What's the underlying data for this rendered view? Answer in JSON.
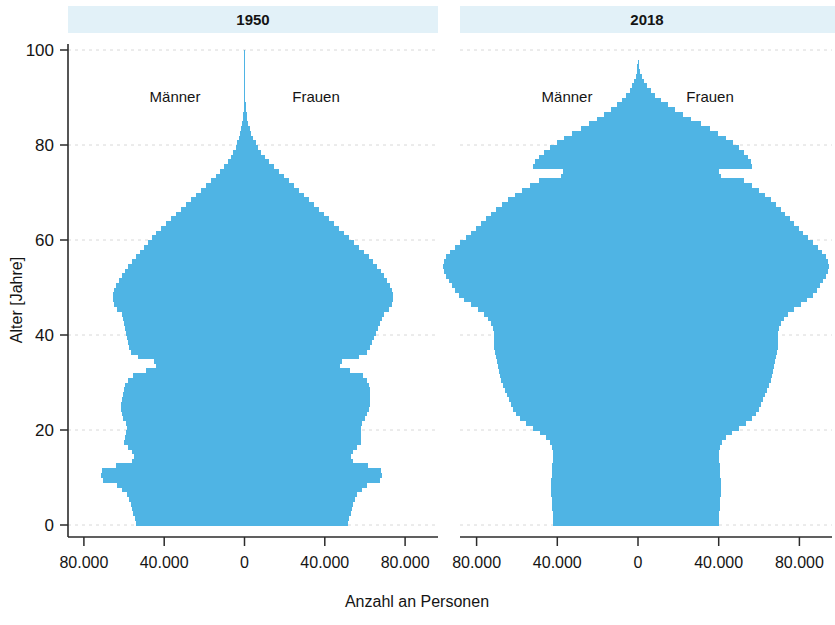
{
  "figure": {
    "xlabel": "Anzahl an Personen",
    "ylabel": "Alter [Jahre]"
  },
  "panels": [
    {
      "title": "1950",
      "male_label": "Männer",
      "female_label": "Frauen",
      "xticks": [
        "80.000",
        "40.000",
        "0",
        "40.000",
        "80.000"
      ]
    },
    {
      "title": "2018",
      "male_label": "Männer",
      "female_label": "Frauen",
      "xticks": [
        "80.000",
        "40.000",
        "0",
        "40.000",
        "80.000"
      ]
    }
  ],
  "yticks": [
    "0",
    "20",
    "40",
    "60",
    "80",
    "100"
  ],
  "colors": {
    "bar": "#4fb4e4",
    "panel_title_bg": "#e2f1f8",
    "axis": "#2b2b2b",
    "grid": "#d8d8d8",
    "text": "#141414"
  },
  "chart_data": {
    "type": "bar",
    "orientation": "horizontal",
    "subtype": "population-pyramid",
    "title": "",
    "xlabel": "Anzahl an Personen",
    "ylabel": "Alter [Jahre]",
    "xlim": [
      -100000,
      100000
    ],
    "ylim": [
      0,
      103
    ],
    "xtick_values": [
      -80000,
      -40000,
      0,
      40000,
      80000
    ],
    "xtick_labels": [
      "80.000",
      "40.000",
      "0",
      "40.000",
      "80.000"
    ],
    "ytick_values": [
      0,
      20,
      40,
      60,
      80,
      100
    ],
    "ytick_labels": [
      "0",
      "20",
      "40",
      "60",
      "80",
      "100"
    ],
    "grid": true,
    "legend": false,
    "ages": [
      0,
      1,
      2,
      3,
      4,
      5,
      6,
      7,
      8,
      9,
      10,
      11,
      12,
      13,
      14,
      15,
      16,
      17,
      18,
      19,
      20,
      21,
      22,
      23,
      24,
      25,
      26,
      27,
      28,
      29,
      30,
      31,
      32,
      33,
      34,
      35,
      36,
      37,
      38,
      39,
      40,
      41,
      42,
      43,
      44,
      45,
      46,
      47,
      48,
      49,
      50,
      51,
      52,
      53,
      54,
      55,
      56,
      57,
      58,
      59,
      60,
      61,
      62,
      63,
      64,
      65,
      66,
      67,
      68,
      69,
      70,
      71,
      72,
      73,
      74,
      75,
      76,
      77,
      78,
      79,
      80,
      81,
      82,
      83,
      84,
      85,
      86,
      87,
      88,
      89,
      90,
      91,
      92,
      93,
      94,
      95,
      96,
      97,
      98,
      99,
      100
    ],
    "panels": [
      {
        "name": "1950",
        "series": [
          {
            "name": "Männer",
            "side": "left",
            "values": [
              54000,
              54500,
              55500,
              56000,
              56500,
              57500,
              58500,
              61000,
              63500,
              70500,
              71500,
              71000,
              64000,
              56000,
              55000,
              56000,
              58000,
              60000,
              59500,
              59000,
              58500,
              59000,
              60500,
              61000,
              61500,
              61500,
              61000,
              60500,
              60000,
              59500,
              58000,
              55500,
              49000,
              44000,
              45000,
              53000,
              56500,
              57500,
              58000,
              58500,
              59000,
              59500,
              60000,
              60500,
              61000,
              63500,
              65000,
              65500,
              65500,
              65000,
              64000,
              62500,
              61000,
              59500,
              58000,
              56000,
              54000,
              52000,
              50000,
              48000,
              46000,
              44000,
              41500,
              39000,
              36500,
              34000,
              31500,
              29000,
              26500,
              24000,
              21500,
              19000,
              16500,
              14000,
              12000,
              10000,
              8200,
              6800,
              5500,
              4400,
              3500,
              2700,
              2100,
              1600,
              1200,
              900,
              650,
              480,
              340,
              240,
              165,
              110,
              75,
              48,
              30,
              18,
              10,
              6,
              3,
              1
            ]
          },
          {
            "name": "Frauen",
            "side": "right",
            "values": [
              51500,
              52000,
              53000,
              53500,
              54000,
              55000,
              56000,
              58500,
              61000,
              67500,
              68500,
              68000,
              61500,
              54000,
              53000,
              54000,
              56000,
              58000,
              58000,
              58000,
              58000,
              58500,
              60000,
              61000,
              62000,
              62500,
              62500,
              62500,
              62500,
              62000,
              61000,
              59000,
              52500,
              47500,
              48500,
              57000,
              61000,
              62500,
              63500,
              64500,
              65500,
              66500,
              67500,
              68500,
              69500,
              72000,
              73500,
              74000,
              74000,
              73500,
              72500,
              71000,
              69500,
              68000,
              66000,
              64000,
              62000,
              59500,
              57000,
              54500,
              52000,
              49500,
              47000,
              44500,
              42000,
              39500,
              37000,
              34500,
              32000,
              29500,
              27000,
              24500,
              22000,
              19500,
              17000,
              14500,
              12200,
              10200,
              8400,
              6800,
              5500,
              4300,
              3300,
              2500,
              1900,
              1400,
              1000,
              720,
              500,
              340,
              225,
              145,
              95,
              58,
              35,
              20,
              12,
              7,
              4,
              2
            ]
          }
        ]
      },
      {
        "name": "2018",
        "series": [
          {
            "name": "Männer",
            "side": "left",
            "values": [
              42000,
              42000,
              42200,
              42400,
              42600,
              42800,
              43000,
              43000,
              43000,
              43000,
              42800,
              42600,
              42400,
              42200,
              42000,
              42000,
              42500,
              43500,
              45500,
              48500,
              52000,
              55500,
              58500,
              60500,
              62000,
              63000,
              64000,
              65000,
              66000,
              67000,
              68000,
              68500,
              69000,
              69500,
              70000,
              70500,
              71000,
              71500,
              71500,
              71500,
              71500,
              72000,
              73000,
              74500,
              76500,
              79500,
              83000,
              86000,
              88500,
              90500,
              92000,
              93500,
              95000,
              96000,
              96500,
              96000,
              95000,
              93000,
              90500,
              88000,
              85500,
              83000,
              80500,
              78000,
              75500,
              73000,
              70500,
              67500,
              64500,
              61000,
              57500,
              53500,
              49000,
              38000,
              37000,
              52000,
              51000,
              49000,
              46500,
              43500,
              40000,
              36500,
              32500,
              28500,
              24500,
              20500,
              16800,
              13500,
              10500,
              8000,
              5800,
              4100,
              2800,
              1800,
              1100,
              650,
              350,
              180,
              90,
              40,
              15
            ]
          },
          {
            "name": "Frauen",
            "side": "right",
            "values": [
              40000,
              40000,
              40200,
              40400,
              40600,
              40800,
              41000,
              41000,
              41000,
              41000,
              40800,
              40600,
              40400,
              40200,
              40000,
              40000,
              40500,
              41500,
              43500,
              46500,
              50000,
              53500,
              56500,
              58500,
              60000,
              61000,
              62000,
              63000,
              64000,
              65000,
              66000,
              66500,
              67000,
              67500,
              68000,
              68500,
              69000,
              69500,
              69500,
              69500,
              69500,
              70000,
              71000,
              72500,
              74500,
              77500,
              81000,
              84000,
              86500,
              88500,
              90000,
              91500,
              93000,
              94000,
              94500,
              94000,
              93000,
              91000,
              89000,
              86500,
              84500,
              82000,
              80000,
              77500,
              75500,
              73000,
              71000,
              68500,
              66000,
              63000,
              60000,
              56500,
              52500,
              41000,
              40000,
              56500,
              56000,
              54500,
              52500,
              50000,
              47000,
              43500,
              39500,
              35500,
              31000,
              26500,
              22500,
              18500,
              14800,
              11500,
              8600,
              6200,
              4300,
              2900,
              1800,
              1100,
              620,
              330,
              170,
              80,
              30
            ]
          }
        ]
      }
    ]
  }
}
